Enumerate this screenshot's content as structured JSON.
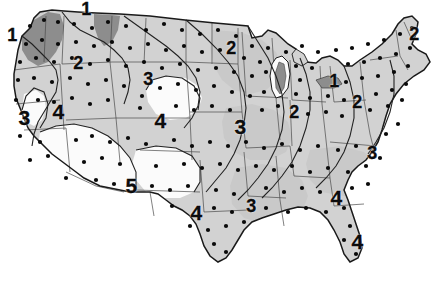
{
  "figure": {
    "name": "us-contour-map",
    "type": "isoline-map",
    "region": "Contiguous United States",
    "caption_fragment": "",
    "colors": {
      "background": "#ffffff",
      "land_light": "#d2d2d2",
      "land_mid": "#c0c0c0",
      "land_dark": "#8d8d8d",
      "land_white": "#fbfbfb",
      "outline": "#1a1a1a",
      "state_border": "#4a4a4a",
      "contour_line": "#222222",
      "station_dot": "#0a0a0a",
      "label_text": "#0d0d0d"
    }
  },
  "chart_data": {
    "type": "contour_map",
    "title": "",
    "xlabel": "",
    "ylabel": "",
    "value_range": [
      1,
      5
    ],
    "legend": [],
    "grid": false,
    "contour_levels": [
      1,
      2,
      3,
      4,
      5
    ],
    "labels": [
      {
        "value": "1",
        "x": 12,
        "y": 35,
        "size": "cl-md",
        "region": "western-washington"
      },
      {
        "value": "1",
        "x": 86,
        "y": 9,
        "size": "cl-md",
        "region": "northern-montana"
      },
      {
        "value": "2",
        "x": 78,
        "y": 63,
        "size": "cl-md",
        "region": "idaho"
      },
      {
        "value": "3",
        "x": 148,
        "y": 79,
        "size": "cl-md",
        "region": "wyoming"
      },
      {
        "value": "2",
        "x": 231,
        "y": 48,
        "size": "cl-md",
        "region": "minnesota"
      },
      {
        "value": "2",
        "x": 414,
        "y": 34,
        "size": "cl-md",
        "region": "maine"
      },
      {
        "value": "1",
        "x": 334,
        "y": 81,
        "size": "cl-md",
        "region": "lake-erie"
      },
      {
        "value": "2",
        "x": 294,
        "y": 112,
        "size": "cl-md",
        "region": "indiana"
      },
      {
        "value": "2",
        "x": 357,
        "y": 102,
        "size": "cl-md",
        "region": "pennsylvania"
      },
      {
        "value": "3",
        "x": 24,
        "y": 117,
        "size": "cl-lg",
        "region": "northern-california"
      },
      {
        "value": "4",
        "x": 58,
        "y": 111,
        "size": "cl-lg",
        "region": "nevada"
      },
      {
        "value": "4",
        "x": 160,
        "y": 120,
        "size": "cl-lg",
        "region": "colorado"
      },
      {
        "value": "3",
        "x": 240,
        "y": 126,
        "size": "cl-lg",
        "region": "missouri"
      },
      {
        "value": "3",
        "x": 372,
        "y": 153,
        "size": "cl-md",
        "region": "north-carolina"
      },
      {
        "value": "5",
        "x": 131,
        "y": 185,
        "size": "cl-lg",
        "region": "new-mexico"
      },
      {
        "value": "4",
        "x": 196,
        "y": 212,
        "size": "cl-lg",
        "region": "texas"
      },
      {
        "value": "3",
        "x": 251,
        "y": 206,
        "size": "cl-md",
        "region": "mississippi"
      },
      {
        "value": "4",
        "x": 336,
        "y": 197,
        "size": "cl-lg",
        "region": "georgia"
      },
      {
        "value": "4",
        "x": 357,
        "y": 241,
        "size": "cl-lg",
        "region": "florida"
      }
    ]
  }
}
